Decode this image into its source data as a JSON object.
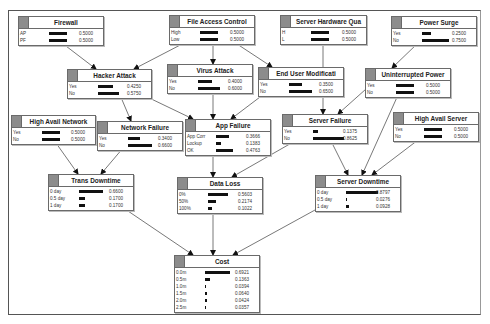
{
  "diagram": {
    "type": "bayesian-network",
    "nodes": [
      {
        "id": "firewall",
        "title": "Firewall",
        "x": 18,
        "y": 16,
        "w": 86,
        "states": [
          {
            "label": "AP",
            "value": "0.5000",
            "p": 0.5
          },
          {
            "label": "PF",
            "value": "0.5000",
            "p": 0.5
          }
        ]
      },
      {
        "id": "file_access_control",
        "title": "File Access Control",
        "x": 169,
        "y": 15,
        "w": 86,
        "states": [
          {
            "label": "High",
            "value": "0.5000",
            "p": 0.5
          },
          {
            "label": "Low",
            "value": "0.5000",
            "p": 0.5
          }
        ]
      },
      {
        "id": "server_hardware_quality",
        "title": "Server Hardware Qua",
        "x": 280,
        "y": 15,
        "w": 87,
        "states": [
          {
            "label": "H",
            "value": "0.5000",
            "p": 0.5
          },
          {
            "label": "L",
            "value": "0.5000",
            "p": 0.5
          }
        ]
      },
      {
        "id": "power_surge",
        "title": "Power Surge",
        "x": 391,
        "y": 16,
        "w": 86,
        "states": [
          {
            "label": "Yes",
            "value": "0.2500",
            "p": 0.25
          },
          {
            "label": "No",
            "value": "0.7500",
            "p": 0.75
          }
        ]
      },
      {
        "id": "hacker_attack",
        "title": "Hacker Attack",
        "x": 67,
        "y": 69,
        "w": 85,
        "states": [
          {
            "label": "Yes",
            "value": "0.4250",
            "p": 0.425
          },
          {
            "label": "No",
            "value": "0.5750",
            "p": 0.575
          }
        ]
      },
      {
        "id": "virus_attack",
        "title": "Virus Attack",
        "x": 167,
        "y": 64,
        "w": 86,
        "states": [
          {
            "label": "Yes",
            "value": "0.4000",
            "p": 0.4
          },
          {
            "label": "No",
            "value": "0.6000",
            "p": 0.6
          }
        ]
      },
      {
        "id": "end_user_modification",
        "title": "End User Modificati",
        "x": 258,
        "y": 67,
        "w": 86,
        "states": [
          {
            "label": "Yes",
            "value": "0.3500",
            "p": 0.35
          },
          {
            "label": "No",
            "value": "0.6500",
            "p": 0.65
          }
        ]
      },
      {
        "id": "uninterrupted_power",
        "title": "Uninterrupted Power",
        "x": 365,
        "y": 68,
        "w": 86,
        "states": [
          {
            "label": "Yes",
            "value": "0.5000",
            "p": 0.5
          },
          {
            "label": "No",
            "value": "0.5000",
            "p": 0.5
          }
        ]
      },
      {
        "id": "high_avail_network",
        "title": "High Avail Network",
        "x": 11,
        "y": 115,
        "w": 85,
        "states": [
          {
            "label": "Yes",
            "value": "0.5000",
            "p": 0.5
          },
          {
            "label": "No",
            "value": "0.5000",
            "p": 0.5
          }
        ]
      },
      {
        "id": "network_failure",
        "title": "Network Failure",
        "x": 97,
        "y": 121,
        "w": 86,
        "states": [
          {
            "label": "Yes",
            "value": "0.3400",
            "p": 0.34
          },
          {
            "label": "No",
            "value": "0.6600",
            "p": 0.66
          }
        ]
      },
      {
        "id": "app_failure",
        "title": "App Failure",
        "x": 185,
        "y": 119,
        "w": 86,
        "states": [
          {
            "label": "App Corr",
            "value": "0.3666",
            "p": 0.3666
          },
          {
            "label": "Lockup",
            "value": "0.1383",
            "p": 0.1383
          },
          {
            "label": "OK",
            "value": "0.4763",
            "p": 0.4763
          }
        ]
      },
      {
        "id": "server_failure",
        "title": "Server Failure",
        "x": 282,
        "y": 114,
        "w": 86,
        "states": [
          {
            "label": "Yes",
            "value": "0.1375",
            "p": 0.1375
          },
          {
            "label": "No",
            "value": "0.8625",
            "p": 0.8625
          }
        ]
      },
      {
        "id": "high_avail_server",
        "title": "High Avail Server",
        "x": 393,
        "y": 112,
        "w": 86,
        "states": [
          {
            "label": "Yes",
            "value": "0.5000",
            "p": 0.5
          },
          {
            "label": "No",
            "value": "0.5000",
            "p": 0.5
          }
        ]
      },
      {
        "id": "trans_downtime",
        "title": "Trans Downtime",
        "x": 48,
        "y": 174,
        "w": 86,
        "states": [
          {
            "label": "0 day",
            "value": "0.6600",
            "p": 0.66
          },
          {
            "label": "0.5 day",
            "value": "0.1700",
            "p": 0.17
          },
          {
            "label": "1 day",
            "value": "0.1700",
            "p": 0.17
          }
        ]
      },
      {
        "id": "data_loss",
        "title": "Data Loss",
        "x": 177,
        "y": 177,
        "w": 86,
        "states": [
          {
            "label": "0%",
            "value": "0.5603",
            "p": 0.5603
          },
          {
            "label": "50%",
            "value": "0.2174",
            "p": 0.2174
          },
          {
            "label": "100%",
            "value": "0.1022",
            "p": 0.1022
          }
        ]
      },
      {
        "id": "server_downtime",
        "title": "Server Downtime",
        "x": 315,
        "y": 175,
        "w": 86,
        "states": [
          {
            "label": "0 day",
            "value": "0.8797",
            "p": 0.8797
          },
          {
            "label": "0.5 day",
            "value": "0.0276",
            "p": 0.0276
          },
          {
            "label": "1 day",
            "value": "0.0928",
            "p": 0.0928
          }
        ]
      },
      {
        "id": "cost",
        "title": "Cost",
        "x": 174,
        "y": 255,
        "w": 86,
        "states": [
          {
            "label": "0.0m",
            "value": "0.6921",
            "p": 0.6921
          },
          {
            "label": "0.5m",
            "value": "0.1363",
            "p": 0.1363
          },
          {
            "label": "1.0m",
            "value": "0.0394",
            "p": 0.0394
          },
          {
            "label": "1.5m",
            "value": "0.0640",
            "p": 0.064
          },
          {
            "label": "2.0m",
            "value": "0.0424",
            "p": 0.0424
          },
          {
            "label": "2.5m",
            "value": "0.0357",
            "p": 0.0357
          }
        ]
      }
    ],
    "edges": [
      {
        "from": "firewall",
        "to": "hacker_attack",
        "x1": 62,
        "y1": 43,
        "x2": 96,
        "y2": 69
      },
      {
        "from": "file_access_control",
        "to": "hacker_attack",
        "x1": 186,
        "y1": 42,
        "x2": 134,
        "y2": 69
      },
      {
        "from": "file_access_control",
        "to": "virus_attack",
        "x1": 213,
        "y1": 42,
        "x2": 213,
        "y2": 64
      },
      {
        "from": "file_access_control",
        "to": "end_user_modification",
        "x1": 234,
        "y1": 42,
        "x2": 272,
        "y2": 67
      },
      {
        "from": "server_hardware_quality",
        "to": "server_failure",
        "x1": 323,
        "y1": 42,
        "x2": 323,
        "y2": 114
      },
      {
        "from": "power_surge",
        "to": "uninterrupted_power",
        "x1": 418,
        "y1": 43,
        "x2": 392,
        "y2": 68
      },
      {
        "from": "hacker_attack",
        "to": "network_failure",
        "x1": 120,
        "y1": 95,
        "x2": 131,
        "y2": 121
      },
      {
        "from": "hacker_attack",
        "to": "app_failure",
        "x1": 143,
        "y1": 95,
        "x2": 193,
        "y2": 119
      },
      {
        "from": "virus_attack",
        "to": "app_failure",
        "x1": 213,
        "y1": 91,
        "x2": 213,
        "y2": 119
      },
      {
        "from": "end_user_modification",
        "to": "app_failure",
        "x1": 264,
        "y1": 94,
        "x2": 231,
        "y2": 119
      },
      {
        "from": "uninterrupted_power",
        "to": "server_failure",
        "x1": 366,
        "y1": 89,
        "x2": 338,
        "y2": 114
      },
      {
        "from": "uninterrupted_power",
        "to": "server_downtime",
        "x1": 398,
        "y1": 95,
        "x2": 362,
        "y2": 175
      },
      {
        "from": "high_avail_network",
        "to": "trans_downtime",
        "x1": 56,
        "y1": 143,
        "x2": 78,
        "y2": 174
      },
      {
        "from": "network_failure",
        "to": "trans_downtime",
        "x1": 123,
        "y1": 148,
        "x2": 101,
        "y2": 174
      },
      {
        "from": "app_failure",
        "to": "data_loss",
        "x1": 213,
        "y1": 155,
        "x2": 213,
        "y2": 177
      },
      {
        "from": "server_failure",
        "to": "data_loss",
        "x1": 295,
        "y1": 141,
        "x2": 232,
        "y2": 177
      },
      {
        "from": "server_failure",
        "to": "server_downtime",
        "x1": 331,
        "y1": 141,
        "x2": 348,
        "y2": 175
      },
      {
        "from": "high_avail_server",
        "to": "server_downtime",
        "x1": 418,
        "y1": 140,
        "x2": 372,
        "y2": 175
      },
      {
        "from": "trans_downtime",
        "to": "cost",
        "x1": 125,
        "y1": 209,
        "x2": 193,
        "y2": 255
      },
      {
        "from": "data_loss",
        "to": "cost",
        "x1": 213,
        "y1": 212,
        "x2": 213,
        "y2": 255
      },
      {
        "from": "server_downtime",
        "to": "cost",
        "x1": 315,
        "y1": 210,
        "x2": 233,
        "y2": 255
      }
    ]
  },
  "colors": {
    "frame": "#555555",
    "node_border": "#6a6a6a",
    "header_square": "#8c8c8c",
    "bar": "#111111",
    "edge": "#555555",
    "arrow": "#111111"
  }
}
